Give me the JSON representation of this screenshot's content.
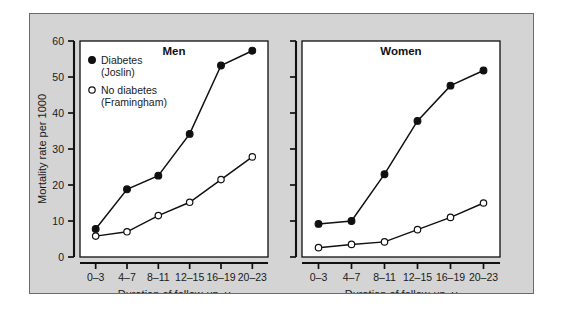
{
  "chart_data": {
    "type": "line",
    "title": "",
    "xlabel": "Duration of follow-up, y",
    "ylabel": "Mortality rate per 1000",
    "categories": [
      "0–3",
      "4–7",
      "8–11",
      "12–15",
      "16–19",
      "20–23"
    ],
    "ylim": [
      0,
      60
    ],
    "yticks": [
      0,
      10,
      20,
      30,
      40,
      50,
      60
    ],
    "ytick_labels": [
      "0",
      "10",
      "20",
      "30",
      "40",
      "50",
      "60"
    ],
    "grid": false,
    "legend_position": "upper-left-inside-panel-1",
    "panels": [
      {
        "title": "Men",
        "series": [
          {
            "name": "Diabetes (Joslin)",
            "marker": "filled-circle",
            "values": [
              7.8,
              18.8,
              22.6,
              34.2,
              53.2,
              57.3
            ]
          },
          {
            "name": "No diabetes (Framingham)",
            "marker": "open-circle",
            "values": [
              5.8,
              7.0,
              11.5,
              15.2,
              21.5,
              27.8
            ]
          }
        ]
      },
      {
        "title": "Women",
        "series": [
          {
            "name": "Diabetes (Joslin)",
            "marker": "filled-circle",
            "values": [
              9.2,
              10.0,
              23.0,
              37.8,
              47.6,
              51.8
            ]
          },
          {
            "name": "No diabetes (Framingham)",
            "marker": "open-circle",
            "values": [
              2.6,
              3.5,
              4.2,
              7.6,
              11.0,
              15.0
            ]
          }
        ]
      }
    ],
    "legend": [
      {
        "marker": "filled-circle",
        "line1": "Diabetes",
        "line2": "(Joslin)"
      },
      {
        "marker": "open-circle",
        "line1": "No diabetes",
        "line2": "(Framingham)"
      }
    ],
    "colors": {
      "figure_background": "#d4d4d4",
      "panel_background": "#ffffff",
      "ink": "#101010",
      "page_background": "#ffffff"
    }
  }
}
